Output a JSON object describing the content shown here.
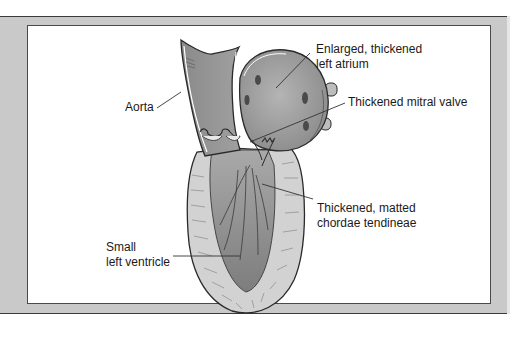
{
  "figure": {
    "colors": {
      "frame_gray": "#c9c9c9",
      "frame_line": "#3a3a3a",
      "panel_bg": "#ffffff",
      "chamber_dark": "#8e8e8e",
      "chamber_light": "#b8b8b8",
      "myocardium": "#cfcfcf",
      "outline": "#2a2a2a",
      "label_text": "#1a1a1a"
    }
  },
  "labels": {
    "aorta": {
      "line1": "Aorta"
    },
    "left_atrium": {
      "line1": "Enlarged, thickened",
      "line2": "left atrium"
    },
    "mitral_valve": {
      "line1": "Thickened mitral valve"
    },
    "chordae": {
      "line1": "Thickened, matted",
      "line2": "chordae tendineae"
    },
    "left_ventricle": {
      "line1": "Small",
      "line2": "left ventricle"
    }
  }
}
